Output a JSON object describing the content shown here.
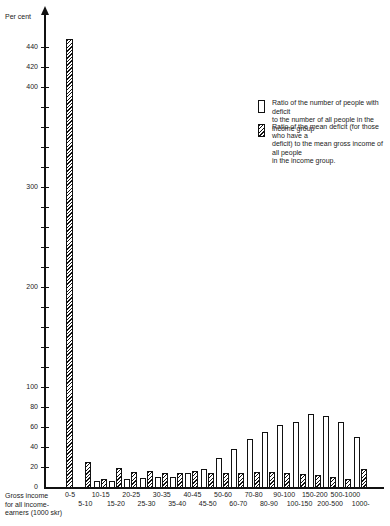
{
  "chart_data": {
    "type": "bar",
    "title": "",
    "ylabel": "Per cent",
    "xlabel": "Gross income for all income-earners (1000 skr)",
    "ylim": [
      0,
      460
    ],
    "yticks": [
      0,
      20,
      40,
      60,
      80,
      100,
      200,
      300,
      400,
      420,
      440
    ],
    "grid": false,
    "legend_position": "upper right",
    "categories": [
      "0-5",
      "5-10",
      "10-15",
      "15-20",
      "20-25",
      "25-30",
      "30-35",
      "35-40",
      "40-45",
      "45-50",
      "50-60",
      "60-70",
      "70-80",
      "80-90",
      "90-100",
      "100-150",
      "150-200",
      "200-500",
      "500-1000",
      "1000-"
    ],
    "series": [
      {
        "name": "Ratio of the number of people with deficit to the number of all people in the income group",
        "style": "white",
        "values": [
          0,
          0,
          6,
          6,
          8,
          9,
          10,
          10,
          14,
          18,
          29,
          38,
          48,
          55,
          62,
          65,
          73,
          71,
          65,
          50
        ]
      },
      {
        "name": "Ratio of the mean deficit (for those who have a deficit) to the mean gross income of all people in the income group.",
        "style": "hatched",
        "values": [
          448,
          25,
          8,
          19,
          15,
          16,
          14,
          14,
          16,
          14,
          14,
          14,
          15,
          15,
          14,
          13,
          12,
          10,
          8,
          18
        ]
      }
    ]
  },
  "labels": {
    "ylabel": "Per cent",
    "xtitle": "Gross income\nfor all income-\nearners (1000 skr)",
    "legend1": "Ratio of the number of people with deficit\nto the number of all people in the income group",
    "legend2": "Ratio of the mean deficit (for those who have a\ndeficit) to the mean gross income of all people\nin the income group."
  }
}
